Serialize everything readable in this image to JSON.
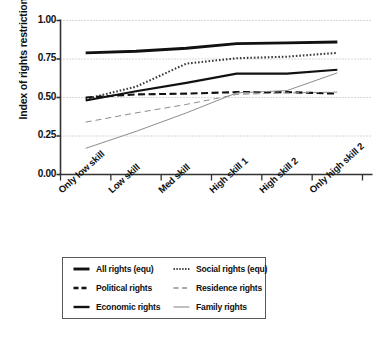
{
  "chart_data": {
    "type": "line",
    "title": "",
    "xlabel": "",
    "ylabel": "Index of rights restrictions",
    "categories": [
      "Only low skill",
      "Low skill",
      "Med skill",
      "High skill 1",
      "High skill 2",
      "Only high skill 2"
    ],
    "ylim": [
      0.0,
      1.0
    ],
    "yticks": [
      "0.00",
      "0.25",
      "0.50",
      "0.75",
      "1.00"
    ],
    "ytick_values": [
      0.0,
      0.25,
      0.5,
      0.75,
      1.0
    ],
    "grid": "horizontal-dotted",
    "legend_position": "below-plot",
    "series": [
      {
        "name": "All rights (equ)",
        "style": "solid",
        "width": "thick",
        "color": "#111111",
        "values": [
          0.79,
          0.8,
          0.82,
          0.85,
          0.855,
          0.86
        ]
      },
      {
        "name": "Social rights (equ)",
        "style": "dotted",
        "width": "medium",
        "color": "#3b3b3b",
        "values": [
          0.49,
          0.57,
          0.72,
          0.755,
          0.765,
          0.79
        ]
      },
      {
        "name": "Political rights",
        "style": "dashed",
        "width": "medium",
        "color": "#111111",
        "values": [
          0.5,
          0.52,
          0.525,
          0.535,
          0.535,
          0.525
        ]
      },
      {
        "name": "Residence rights",
        "style": "dashed-light",
        "width": "thin",
        "color": "#8d8d8d",
        "values": [
          0.34,
          0.4,
          0.455,
          0.52,
          0.53,
          0.535
        ]
      },
      {
        "name": "Economic rights",
        "style": "solid",
        "width": "medium",
        "color": "#111111",
        "values": [
          0.48,
          0.54,
          0.595,
          0.655,
          0.655,
          0.68
        ]
      },
      {
        "name": "Family rights",
        "style": "solid",
        "width": "thin",
        "color": "#8d8d8d",
        "values": [
          0.17,
          0.28,
          0.4,
          0.53,
          0.545,
          0.66
        ]
      }
    ]
  },
  "axis": {
    "y_title": "Index of rights restrictions"
  },
  "legend": {
    "entries": [
      {
        "label": "All rights (equ)",
        "swatch": "thick-solid-line-icon"
      },
      {
        "label": "Social rights (equ)",
        "swatch": "dotted-line-icon"
      },
      {
        "label": "Political rights",
        "swatch": "dashed-line-icon"
      },
      {
        "label": "Residence rights",
        "swatch": "light-dashed-line-icon"
      },
      {
        "label": "Economic rights",
        "swatch": "solid-line-icon"
      },
      {
        "label": "Family rights",
        "swatch": "thin-solid-line-icon"
      }
    ]
  }
}
